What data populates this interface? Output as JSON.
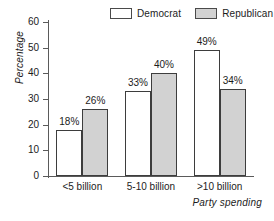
{
  "chart_data": {
    "type": "bar",
    "title": "",
    "xlabel": "Party spending",
    "ylabel": "Percentage",
    "categories": [
      "<5 billion",
      "5-10 billion",
      ">10 billion"
    ],
    "series": [
      {
        "name": "Democrat",
        "values": [
          18,
          33,
          49
        ],
        "labels": [
          "18%",
          "33%",
          "49%"
        ],
        "color": "#ffffff"
      },
      {
        "name": "Republican",
        "values": [
          26,
          40,
          34
        ],
        "labels": [
          "26%",
          "40%",
          "34%"
        ],
        "color": "#d2d2d2"
      }
    ],
    "ylim": [
      0,
      60
    ],
    "yticks": [
      0,
      10,
      20,
      30,
      40,
      50,
      60
    ],
    "ytick_labels": [
      "0",
      "10",
      "20",
      "30",
      "40",
      "50",
      "60"
    ],
    "grid": false,
    "legend_position": "top-center"
  },
  "legend": {
    "democrat_label": "Democrat",
    "republican_label": "Republican"
  },
  "axes": {
    "y_title": "Percentage",
    "x_title": "Party spending"
  }
}
